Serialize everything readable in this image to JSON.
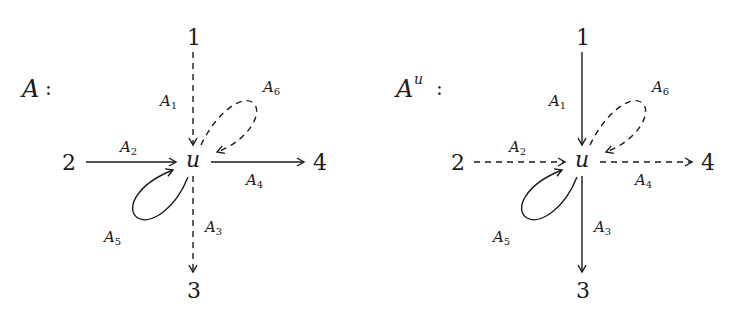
{
  "diagrams": [
    {
      "title": "A",
      "title_sup": "",
      "colon": ":",
      "center": "u",
      "nodes": {
        "top": "1",
        "left": "2",
        "right": "4",
        "bottom": "3"
      },
      "edges": {
        "A1": {
          "label": "A",
          "sub": "1",
          "style": "dashed"
        },
        "A2": {
          "label": "A",
          "sub": "2",
          "style": "solid"
        },
        "A3": {
          "label": "A",
          "sub": "3",
          "style": "dashed"
        },
        "A4": {
          "label": "A",
          "sub": "4",
          "style": "solid"
        },
        "A5": {
          "label": "A",
          "sub": "5",
          "style": "solid"
        },
        "A6": {
          "label": "A",
          "sub": "6",
          "style": "dashed"
        }
      }
    },
    {
      "title": "A",
      "title_sup": "u",
      "colon": ":",
      "center": "u",
      "nodes": {
        "top": "1",
        "left": "2",
        "right": "4",
        "bottom": "3"
      },
      "edges": {
        "A1": {
          "label": "A",
          "sub": "1",
          "style": "solid"
        },
        "A2": {
          "label": "A",
          "sub": "2",
          "style": "dashed"
        },
        "A3": {
          "label": "A",
          "sub": "3",
          "style": "solid"
        },
        "A4": {
          "label": "A",
          "sub": "4",
          "style": "dashed"
        },
        "A5": {
          "label": "A",
          "sub": "5",
          "style": "solid"
        },
        "A6": {
          "label": "A",
          "sub": "6",
          "style": "dashed"
        }
      }
    }
  ]
}
